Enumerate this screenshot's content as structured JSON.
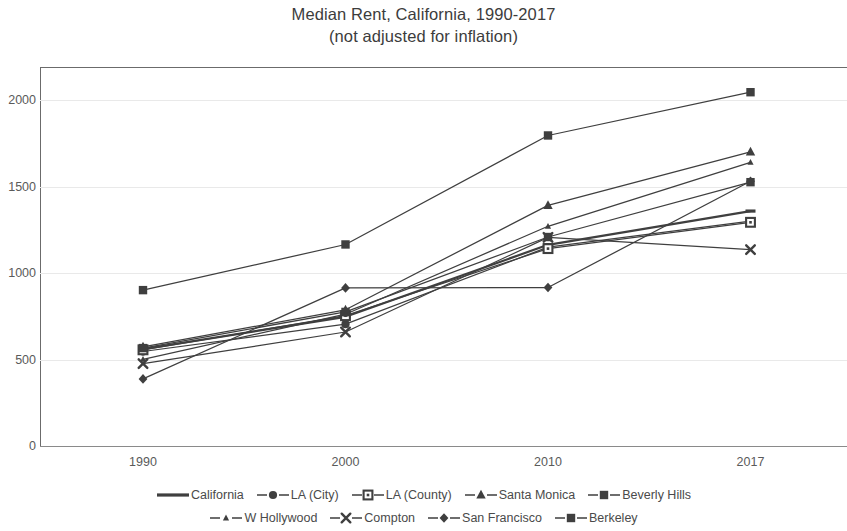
{
  "chart_data": {
    "type": "line",
    "title": "Median Rent, California, 1990-2017",
    "subtitle": "(not adjusted for inflation)",
    "xlabel": "",
    "ylabel": "",
    "categories": [
      "1990",
      "2000",
      "2010",
      "2017"
    ],
    "x": [
      1990,
      2000,
      2010,
      2017
    ],
    "ylim": [
      0,
      2200
    ],
    "yticks": [
      0,
      500,
      1000,
      1500,
      2000
    ],
    "ytick_labels": [
      "0",
      "500",
      "1000",
      "1500",
      "2000"
    ],
    "grid": true,
    "legend_position": "bottom",
    "series": [
      {
        "name": "California",
        "marker": "line",
        "values": [
          560,
          747,
          1163,
          1358
        ]
      },
      {
        "name": "LA (City)",
        "marker": "circle",
        "values": [
          546,
          704,
          1150,
          1300
        ]
      },
      {
        "name": "LA (County)",
        "marker": "open-square",
        "values": [
          556,
          753,
          1141,
          1293
        ]
      },
      {
        "name": "Santa Monica",
        "marker": "triangle",
        "values": [
          573,
          787,
          1391,
          1700
        ]
      },
      {
        "name": "Beverly Hills",
        "marker": "square",
        "values": [
          566,
          775,
          1208,
          1525
        ]
      },
      {
        "name": "W Hollywood",
        "marker": "small-dot",
        "values": [
          501,
          762,
          1270,
          1640
        ]
      },
      {
        "name": "Compton",
        "marker": "x",
        "values": [
          476,
          659,
          1206,
          1135
        ]
      },
      {
        "name": "San Francisco",
        "marker": "diamond",
        "values": [
          388,
          914,
          916,
          1530
        ]
      },
      {
        "name": "Berkeley",
        "marker": "square",
        "values": [
          901,
          1165,
          1795,
          2045
        ]
      }
    ],
    "colors": {
      "series_line": "#3f3f3f",
      "axis": "#6b6b6b",
      "grid": "#e9e9e9",
      "text": "#4a4a4a",
      "background": "#ffffff"
    }
  }
}
